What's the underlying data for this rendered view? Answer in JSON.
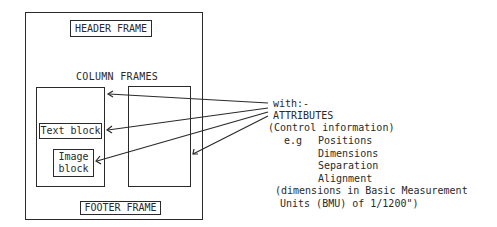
{
  "diagram": {
    "page_frame": {},
    "header_frame": {
      "label": "HEADER FRAME"
    },
    "column_frames_title": "COLUMN FRAMES",
    "text_block": {
      "label": "Text block"
    },
    "image_block": {
      "label_line1": "Image",
      "label_line2": "block"
    },
    "footer_frame": {
      "label": "FOOTER FRAME"
    },
    "annotation": {
      "line1": "with:-",
      "line2": "ATTRIBUTES",
      "line3": "(Control information)",
      "eg_label": "e.g",
      "examples": [
        "Positions",
        "Dimensions",
        "Separation",
        "Alignment"
      ],
      "footnote_line1": "(dimensions in Basic Measurement",
      "footnote_line2": "Units (BMU) of 1/1200\")"
    },
    "arrows": [
      {
        "target": "left-column-frame"
      },
      {
        "target": "text-block"
      },
      {
        "target": "image-block"
      },
      {
        "target": "right-column-frame"
      }
    ],
    "stroke_color": "#2a2a2a"
  }
}
